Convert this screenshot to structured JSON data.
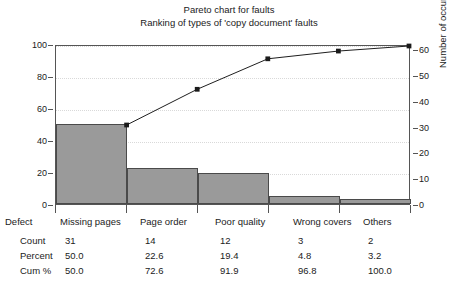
{
  "chart_data": {
    "type": "bar",
    "title": "Pareto chart for faults",
    "subtitle": "Ranking of types of 'copy document' faults",
    "categories": [
      "Missing pages",
      "Page order",
      "Poor quality",
      "Wrong covers",
      "Others"
    ],
    "series": [
      {
        "name": "Count",
        "values": [
          31,
          14,
          12,
          3,
          2
        ]
      },
      {
        "name": "Percent",
        "values": [
          50.0,
          22.6,
          19.4,
          4.8,
          3.2
        ]
      },
      {
        "name": "Cum %",
        "values": [
          50.0,
          72.6,
          91.9,
          96.8,
          100.0
        ]
      }
    ],
    "xlabel": "Defect",
    "ylabel": "Percent",
    "ylabel_right": "Number of occurrences",
    "ylim": [
      0,
      100
    ],
    "ylim_right": [
      0,
      62
    ],
    "yticks": [
      0,
      20,
      40,
      60,
      80,
      100
    ],
    "yticks_right": [
      0,
      10,
      20,
      30,
      40,
      50,
      60
    ],
    "grid": true,
    "legend": "none",
    "bar_color": "#9a9a9a",
    "bar_edge_color": "#4a4a4a",
    "line_color": "#1b1b1b",
    "marker": "square"
  },
  "table": {
    "header_label": "Defect",
    "columns": [
      "Missing pages",
      "Page order",
      "Poor quality",
      "Wrong covers",
      "Others"
    ],
    "rows": [
      {
        "label": "Count",
        "values": [
          "31",
          "14",
          "12",
          "3",
          "2"
        ]
      },
      {
        "label": "Percent",
        "values": [
          "50.0",
          "22.6",
          "19.4",
          "4.8",
          "3.2"
        ]
      },
      {
        "label": "Cum %",
        "values": [
          "50.0",
          "72.6",
          "91.9",
          "96.8",
          "100.0"
        ]
      }
    ]
  },
  "axis_labels": {
    "left_ticks": [
      "100",
      "80",
      "60",
      "40",
      "20",
      "0"
    ],
    "right_ticks": [
      "60",
      "50",
      "40",
      "30",
      "20",
      "10",
      "0"
    ],
    "left_title": "Percent",
    "right_title": "Number of occurrences"
  }
}
